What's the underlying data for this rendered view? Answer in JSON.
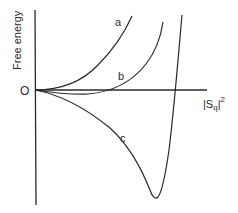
{
  "diagram": {
    "y_axis_label": "Free energy",
    "x_axis_label": "|S",
    "x_axis_label_sub": "q",
    "x_axis_label_close": "|",
    "x_axis_label_sup": "2",
    "origin_label": "O",
    "curves": [
      {
        "id": "a",
        "label": "a",
        "description": "monotonically increasing free energy"
      },
      {
        "id": "b",
        "label": "b",
        "description": "shallow minimum slightly below zero, then increases"
      },
      {
        "id": "c",
        "label": "c",
        "description": "deep minimum well below zero, then sharp rise"
      }
    ],
    "stroke_color": "#2a2a2a",
    "background": "#ffffff"
  }
}
